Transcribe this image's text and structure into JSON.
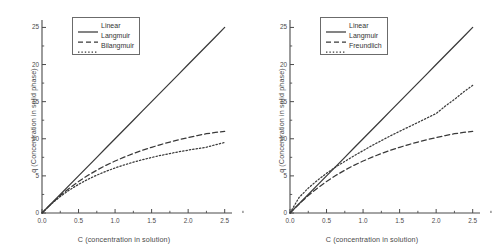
{
  "figure": {
    "background": "#ffffff",
    "line_color": "#3a3a3a",
    "axis_color": "#4a4a4a"
  },
  "chart_data": [
    {
      "type": "line",
      "panel": "left",
      "title": "",
      "xlabel": "C (concentration in solution)",
      "ylabel": "q (Concentration in solid phase)",
      "xlim": [
        0.0,
        2.6
      ],
      "ylim": [
        0,
        26
      ],
      "xticks": [
        0.0,
        0.5,
        1.0,
        1.5,
        2.0,
        2.5
      ],
      "xticklabels": [
        "0.0",
        "0.5",
        "1.0",
        "1.5",
        "2.0",
        "2.5"
      ],
      "yticks": [
        0,
        5,
        10,
        15,
        20,
        25
      ],
      "yticklabels": [
        "0",
        "5",
        "10",
        "15",
        "20",
        "25"
      ],
      "grid": false,
      "legend_position": "upper-left",
      "x": [
        0.0,
        0.125,
        0.25,
        0.375,
        0.5,
        0.625,
        0.75,
        0.875,
        1.0,
        1.125,
        1.25,
        1.375,
        1.5,
        1.625,
        1.75,
        1.875,
        2.0,
        2.125,
        2.25,
        2.375,
        2.5
      ],
      "series": [
        {
          "name": "Linear",
          "style": "solid",
          "values": [
            0.0,
            1.25,
            2.5,
            3.75,
            5.0,
            6.25,
            7.5,
            8.75,
            10.0,
            11.25,
            12.5,
            13.75,
            15.0,
            16.25,
            17.5,
            18.75,
            20.0,
            21.25,
            22.5,
            23.75,
            25.0
          ]
        },
        {
          "name": "Langmuir",
          "style": "dashed",
          "values": [
            0.0,
            1.22,
            2.35,
            3.35,
            4.25,
            5.05,
            5.77,
            6.42,
            7.0,
            7.53,
            8.01,
            8.45,
            8.85,
            9.22,
            9.56,
            9.87,
            10.16,
            10.43,
            10.68,
            10.85,
            11.0
          ]
        },
        {
          "name": "Bilangmuir",
          "style": "dotted",
          "values": [
            0.0,
            1.2,
            2.22,
            3.1,
            3.86,
            4.52,
            5.1,
            5.61,
            6.07,
            6.48,
            6.85,
            7.18,
            7.48,
            7.76,
            8.01,
            8.25,
            8.47,
            8.67,
            8.86,
            9.2,
            9.5
          ]
        }
      ]
    },
    {
      "type": "line",
      "panel": "right",
      "title": "",
      "xlabel": "C (concentration in solution)",
      "ylabel": "q (Concentration in solid phase)",
      "xlim": [
        0.0,
        2.6
      ],
      "ylim": [
        0,
        26
      ],
      "xticks": [
        0.0,
        0.5,
        1.0,
        1.5,
        2.0,
        2.5
      ],
      "xticklabels": [
        "0.0",
        "0.5",
        "1.0",
        "1.5",
        "2.0",
        "2.5"
      ],
      "yticks": [
        0,
        5,
        10,
        15,
        20,
        25
      ],
      "yticklabels": [
        "0",
        "5",
        "10",
        "15",
        "20",
        "25"
      ],
      "grid": false,
      "legend_position": "upper-left",
      "x": [
        0.0,
        0.125,
        0.25,
        0.375,
        0.5,
        0.625,
        0.75,
        0.875,
        1.0,
        1.125,
        1.25,
        1.375,
        1.5,
        1.625,
        1.75,
        1.875,
        2.0,
        2.125,
        2.25,
        2.375,
        2.5
      ],
      "series": [
        {
          "name": "Linear",
          "style": "solid",
          "values": [
            0.0,
            1.25,
            2.5,
            3.75,
            5.0,
            6.25,
            7.5,
            8.75,
            10.0,
            11.25,
            12.5,
            13.75,
            15.0,
            16.25,
            17.5,
            18.75,
            20.0,
            21.25,
            22.5,
            23.75,
            25.0
          ]
        },
        {
          "name": "Langmuir",
          "style": "dashed",
          "values": [
            0.0,
            1.22,
            2.35,
            3.35,
            4.25,
            5.05,
            5.77,
            6.42,
            7.0,
            7.53,
            8.01,
            8.45,
            8.85,
            9.22,
            9.56,
            9.87,
            10.16,
            10.43,
            10.68,
            10.85,
            11.0
          ]
        },
        {
          "name": "Freundlich",
          "style": "dotted",
          "values": [
            0.0,
            2.1,
            3.35,
            4.4,
            5.35,
            6.2,
            6.95,
            7.7,
            8.4,
            9.1,
            9.75,
            10.4,
            11.0,
            11.6,
            12.2,
            12.8,
            13.4,
            14.4,
            15.3,
            16.3,
            17.2
          ]
        }
      ]
    }
  ]
}
